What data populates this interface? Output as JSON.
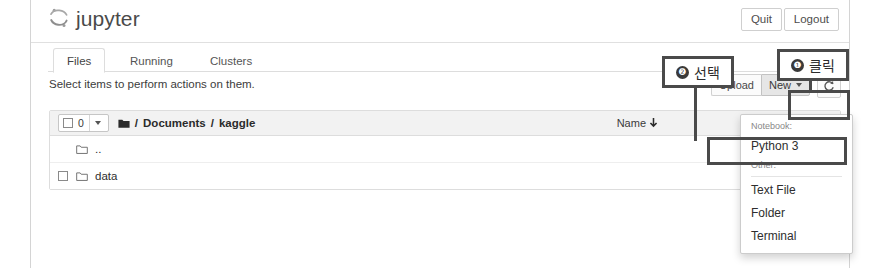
{
  "header": {
    "logo_text": "jupyter",
    "logo_icon": "jupyter-orbit-icon",
    "quit_label": "Quit",
    "logout_label": "Logout"
  },
  "tabs": [
    {
      "label": "Files",
      "name": "files",
      "active": true
    },
    {
      "label": "Running",
      "name": "running",
      "active": false
    },
    {
      "label": "Clusters",
      "name": "clusters",
      "active": false
    }
  ],
  "instruction": "Select items to perform actions on them.",
  "toolbar": {
    "upload_label": "Upload",
    "new_label": "New",
    "new_caret_icon": "caret-down-icon",
    "refresh_icon": "refresh-icon"
  },
  "file_list": {
    "select_count": "0",
    "select_all_caret_icon": "caret-down-icon",
    "folder_icon": "folder-filled-icon",
    "breadcrumb": [
      "Documents",
      "kaggle"
    ],
    "breadcrumb_separator": "/",
    "sort_label": "Name",
    "sort_arrow_icon": "arrow-down-icon",
    "last_modified_label": "Last Modified",
    "rows": [
      {
        "name": "..",
        "icon": "folder-icon",
        "has_checkbox": false
      },
      {
        "name": "data",
        "icon": "folder-icon",
        "has_checkbox": true
      }
    ]
  },
  "new_menu": {
    "notebook_section_label": "Notebook:",
    "notebook_items": [
      "Python 3"
    ],
    "other_section_label": "Other:",
    "other_items": [
      "Text File",
      "Folder",
      "Terminal"
    ]
  },
  "annotations": [
    {
      "number": "❶",
      "label": "클릭",
      "target": "new-button"
    },
    {
      "number": "❷",
      "label": "선택",
      "target": "python-3-menu-item"
    }
  ],
  "colors": {
    "annotation_stroke": "#4a4a4a",
    "active_button_bg": "#e6e6e6",
    "header_row_bg": "#f2f2f2",
    "border": "#dddddd"
  }
}
